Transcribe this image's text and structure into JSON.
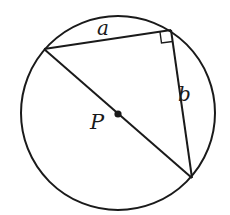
{
  "diagram": {
    "type": "geometry",
    "circle": {
      "center": [
        118,
        115
      ],
      "radius": 97,
      "center_label": "P"
    },
    "triangle": {
      "vertices": {
        "left": [
          44,
          48
        ],
        "right_angle": [
          171,
          30
        ],
        "bottom_right": [
          192,
          178
        ]
      },
      "sides": [
        {
          "label": "a",
          "from": "left",
          "to": "right_angle"
        },
        {
          "label": "b",
          "from": "right_angle",
          "to": "bottom_right"
        },
        {
          "label": "",
          "from": "left",
          "to": "bottom_right",
          "note": "diameter through P"
        }
      ],
      "right_angle_marker_at": "right_angle"
    },
    "labels": {
      "a": "a",
      "b": "b",
      "p": "P"
    },
    "colors": {
      "stroke": "#1a1a1a",
      "background": "#ffffff"
    }
  }
}
